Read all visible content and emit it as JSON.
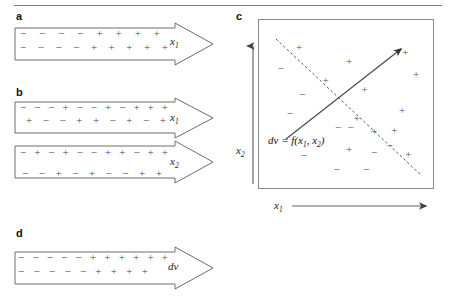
{
  "figure": {
    "background": "#ffffff",
    "stroke_color": "#6d6d6d",
    "symbol_color": "#4a4a4a",
    "top_rule": "horizontal-rule"
  },
  "panels": {
    "a": {
      "letter": "a",
      "arrows": [
        {
          "label": "x",
          "label_sub": "1",
          "rows": [
            [
              "−",
              "−",
              "−",
              "−",
              "+",
              "+",
              "+",
              "+"
            ],
            [
              "−",
              "−",
              "−",
              "−",
              "+",
              "+",
              "+",
              "+",
              "+"
            ]
          ]
        }
      ]
    },
    "b": {
      "letter": "b",
      "arrows": [
        {
          "label": "x",
          "label_sub": "1",
          "rows": [
            [
              "−",
              "−",
              "−",
              "+",
              "−",
              "−",
              "+",
              "−",
              "+",
              "+",
              "+"
            ],
            [
              "+",
              "−",
              "−",
              "+",
              "+",
              "−",
              "+",
              "−",
              "+"
            ]
          ]
        },
        {
          "label": "x",
          "label_sub": "2",
          "rows": [
            [
              "−",
              "+",
              "−",
              "+",
              "−",
              "−",
              "+",
              "+",
              "−",
              "+",
              "+"
            ],
            [
              "−",
              "−",
              "+",
              "−",
              "+",
              "−",
              "−",
              "+",
              "+"
            ]
          ]
        }
      ]
    },
    "c": {
      "letter": "c",
      "x_axis_label": "x",
      "x_axis_sub": "1",
      "y_axis_label": "x",
      "y_axis_sub": "2",
      "equation_prefix": "dv = f(x",
      "equation_sub1": "1",
      "equation_mid": ", x",
      "equation_sub2": "2",
      "equation_suffix": ")",
      "boundary_style": "dashed",
      "gradient_style": "solid-arrow"
    },
    "d": {
      "letter": "d",
      "arrows": [
        {
          "label": "dv",
          "label_sub": "",
          "rows": [
            [
              "−",
              "−",
              "−",
              "−",
              "−",
              "+",
              "+",
              "+",
              "+",
              "+",
              "+"
            ],
            [
              "−",
              "−",
              "−",
              "−",
              "−",
              "+",
              "+",
              "+",
              "+"
            ]
          ]
        }
      ]
    }
  },
  "chart_data": {
    "type": "scatter",
    "title": "",
    "xlabel": "x1",
    "ylabel": "x2",
    "xlim": [
      0,
      100
    ],
    "ylim": [
      0,
      100
    ],
    "grid": false,
    "legend": null,
    "annotations": [
      {
        "text": "dv = f(x1, x2)",
        "x": 8,
        "y": 33,
        "style": "italic"
      }
    ],
    "lines": [
      {
        "name": "decision-boundary",
        "style": "dashed",
        "x": [
          10,
          93
        ],
        "y": [
          88,
          8
        ]
      },
      {
        "name": "gradient-direction",
        "style": "solid-arrow",
        "x": [
          16,
          82
        ],
        "y": [
          30,
          83
        ]
      }
    ],
    "series": [
      {
        "name": "plus",
        "marker": "+",
        "points": [
          [
            20,
            88
          ],
          [
            52,
            79
          ],
          [
            37,
            66
          ],
          [
            88,
            85
          ],
          [
            95,
            70
          ],
          [
            62,
            60
          ],
          [
            86,
            46
          ],
          [
            68,
            32
          ],
          [
            52,
            20
          ],
          [
            81,
            33
          ],
          [
            90,
            17
          ],
          [
            57,
            41
          ]
        ]
      },
      {
        "name": "minus",
        "marker": "−",
        "points": [
          [
            8,
            74
          ],
          [
            22,
            57
          ],
          [
            14,
            44
          ],
          [
            45,
            35
          ],
          [
            53,
            35
          ],
          [
            68,
            18
          ],
          [
            23,
            16
          ],
          [
            44,
            7
          ],
          [
            63,
            7
          ],
          [
            78,
            23
          ]
        ]
      }
    ]
  }
}
